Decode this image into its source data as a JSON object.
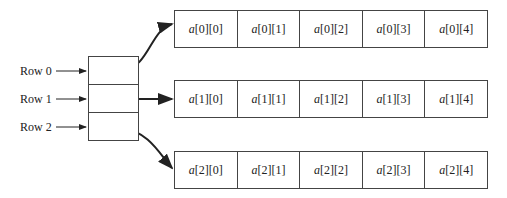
{
  "diagram": {
    "type": "two-dimensional array as array of row pointers",
    "row_labels": [
      "Row 0",
      "Row 1",
      "Row 2"
    ],
    "array_name": "a",
    "rows": [
      {
        "cells": [
          "[0][0]",
          "[0][1]",
          "[0][2]",
          "[0][3]",
          "[0][4]"
        ]
      },
      {
        "cells": [
          "[1][0]",
          "[1][1]",
          "[1][2]",
          "[1][3]",
          "[1][4]"
        ]
      },
      {
        "cells": [
          "[2][0]",
          "[2][1]",
          "[2][2]",
          "[2][3]",
          "[2][4]"
        ]
      }
    ]
  }
}
